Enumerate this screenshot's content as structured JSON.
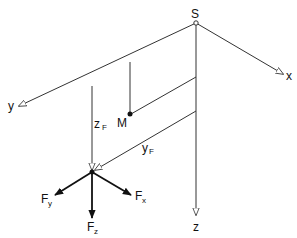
{
  "diagram": {
    "type": "coordinate-system-sketch",
    "origin_label": "S",
    "axes": [
      {
        "name": "x",
        "label": "x",
        "from": [
          196,
          23
        ],
        "to": [
          283,
          74
        ]
      },
      {
        "name": "y",
        "label": "y",
        "from": [
          196,
          23
        ],
        "to": [
          19,
          106
        ]
      },
      {
        "name": "z",
        "label": "z",
        "from": [
          196,
          23
        ],
        "to": [
          196,
          215
        ]
      }
    ],
    "points": {
      "M": {
        "label": "M",
        "at": [
          131,
          114
        ]
      },
      "F": {
        "label": "",
        "at": [
          92,
          172
        ]
      }
    },
    "dimensions": {
      "zF": {
        "main": "z",
        "sub": "F"
      },
      "yF": {
        "main": "y",
        "sub": "F"
      }
    },
    "forces": [
      {
        "name": "Fx",
        "main": "F",
        "sub": "x",
        "to": [
          131,
          195
        ]
      },
      {
        "name": "Fy",
        "main": "F",
        "sub": "y",
        "to": [
          55,
          195
        ]
      },
      {
        "name": "Fz",
        "main": "F",
        "sub": "z",
        "to": [
          92,
          218
        ]
      }
    ],
    "colors": {
      "line": "#333333",
      "force": "#111111",
      "background": "#ffffff"
    }
  }
}
